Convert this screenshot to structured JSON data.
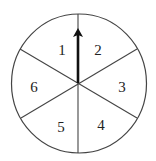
{
  "diagram": {
    "type": "spinner",
    "sections": 6,
    "colors": {
      "stroke": "#444444",
      "arrow": "#111111",
      "background": "#ffffff",
      "label": "#222222"
    },
    "labels": [
      {
        "id": "section-1",
        "text": "1"
      },
      {
        "id": "section-2",
        "text": "2"
      },
      {
        "id": "section-3",
        "text": "3"
      },
      {
        "id": "section-4",
        "text": "4"
      },
      {
        "id": "section-5",
        "text": "5"
      },
      {
        "id": "section-6",
        "text": "6"
      }
    ],
    "pointer": {
      "direction": "up",
      "pointing_between": [
        "1",
        "2"
      ]
    }
  }
}
